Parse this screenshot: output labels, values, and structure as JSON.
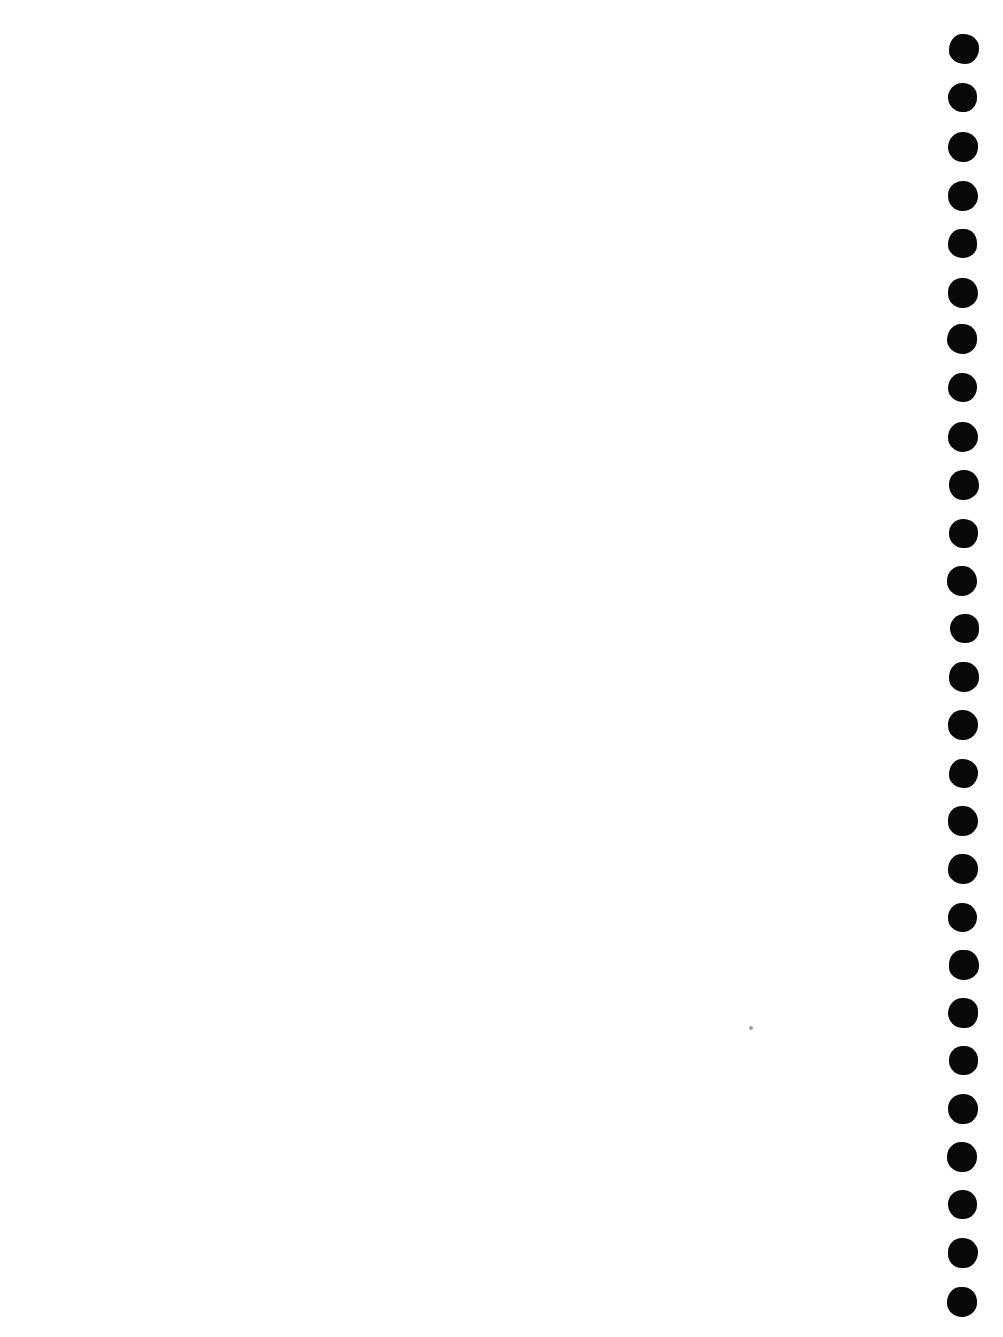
{
  "document": {
    "kind": "scanned-page",
    "page_content_text": "",
    "background_color": "#ffffff",
    "width": 1003,
    "height": 1337
  },
  "binding_marks": {
    "name": "punch-hole-column",
    "description": "vertical column of solid black round binding / punch-hole marks along the right edge",
    "color": "#080808",
    "count": 27,
    "center_x": 963,
    "first_center_y": 50,
    "spacing_y": 48,
    "diameter": 30,
    "items": [
      {
        "cx": 963,
        "cy": 50,
        "d": 30
      },
      {
        "cx": 963,
        "cy": 98,
        "d": 29
      },
      {
        "cx": 963,
        "cy": 147,
        "d": 30
      },
      {
        "cx": 963,
        "cy": 196,
        "d": 30
      },
      {
        "cx": 963,
        "cy": 244,
        "d": 29
      },
      {
        "cx": 963,
        "cy": 292,
        "d": 30
      },
      {
        "cx": 963,
        "cy": 340,
        "d": 30
      },
      {
        "cx": 963,
        "cy": 388,
        "d": 29
      },
      {
        "cx": 963,
        "cy": 436,
        "d": 30
      },
      {
        "cx": 963,
        "cy": 485,
        "d": 30
      },
      {
        "cx": 963,
        "cy": 533,
        "d": 29
      },
      {
        "cx": 963,
        "cy": 581,
        "d": 30
      },
      {
        "cx": 963,
        "cy": 629,
        "d": 29
      },
      {
        "cx": 963,
        "cy": 677,
        "d": 30
      },
      {
        "cx": 963,
        "cy": 725,
        "d": 30
      },
      {
        "cx": 963,
        "cy": 773,
        "d": 29
      },
      {
        "cx": 963,
        "cy": 821,
        "d": 30
      },
      {
        "cx": 963,
        "cy": 869,
        "d": 30
      },
      {
        "cx": 963,
        "cy": 917,
        "d": 29
      },
      {
        "cx": 963,
        "cy": 965,
        "d": 30
      },
      {
        "cx": 963,
        "cy": 1013,
        "d": 30
      },
      {
        "cx": 963,
        "cy": 1061,
        "d": 29
      },
      {
        "cx": 963,
        "cy": 1109,
        "d": 30
      },
      {
        "cx": 963,
        "cy": 1157,
        "d": 30
      },
      {
        "cx": 963,
        "cy": 1205,
        "d": 29
      },
      {
        "cx": 963,
        "cy": 1253,
        "d": 30
      },
      {
        "cx": 963,
        "cy": 1301,
        "d": 30
      }
    ]
  },
  "artifacts": {
    "speck": {
      "name": "scan-speck",
      "color": "#8a8a8a",
      "cx": 751,
      "cy": 1028,
      "d": 4
    }
  }
}
